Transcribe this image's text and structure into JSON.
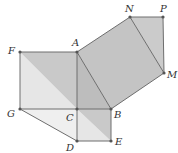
{
  "points": {
    "F": {
      "label": "F",
      "x": 20,
      "y": 52
    },
    "A": {
      "label": "A",
      "x": 77,
      "y": 52
    },
    "N": {
      "label": "N",
      "x": 130,
      "y": 17
    },
    "P": {
      "label": "P",
      "x": 163,
      "y": 17
    },
    "M": {
      "label": "M",
      "x": 164,
      "y": 73
    },
    "B": {
      "label": "B",
      "x": 111,
      "y": 109
    },
    "C": {
      "label": "C",
      "x": 77,
      "y": 109
    },
    "G": {
      "label": "G",
      "x": 20,
      "y": 109
    },
    "D": {
      "label": "D",
      "x": 77,
      "y": 141
    },
    "E": {
      "label": "E",
      "x": 111,
      "y": 141
    }
  },
  "colors": {
    "light": "#e4e4e4",
    "mid": "#cfcfcf",
    "dark": "#bdbdbd",
    "line": "#6e6e6e"
  }
}
